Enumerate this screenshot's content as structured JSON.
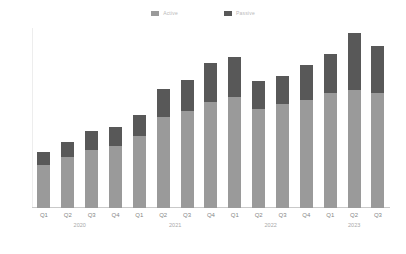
{
  "chart_data": {
    "type": "bar",
    "stacked": true,
    "title": "",
    "subtitle": "",
    "xlabel": "",
    "ylabel": "",
    "categories": [
      "Q1",
      "Q2",
      "Q3",
      "Q4",
      "Q1",
      "Q2",
      "Q3",
      "Q4",
      "Q1",
      "Q2",
      "Q3",
      "Q4",
      "Q1",
      "Q2",
      "Q3"
    ],
    "group_labels": [
      {
        "label": "2020",
        "center_index": 1.5
      },
      {
        "label": "2021",
        "center_index": 5.5
      },
      {
        "label": "2022",
        "center_index": 9.5
      },
      {
        "label": "2023",
        "center_index": 13.0
      }
    ],
    "series": [
      {
        "name": "Active",
        "color": "#9a9a9a",
        "values": [
          1.23,
          1.46,
          1.66,
          1.77,
          2.06,
          2.6,
          2.77,
          3.03,
          3.17,
          2.83,
          2.97,
          3.09,
          3.29,
          3.37,
          3.29
        ]
      },
      {
        "name": "Passive",
        "color": "#585858",
        "values": [
          0.37,
          0.43,
          0.54,
          0.54,
          0.6,
          0.8,
          0.89,
          1.11,
          1.14,
          0.8,
          0.8,
          1.0,
          1.11,
          1.63,
          1.34
        ]
      }
    ],
    "totals": [
      1.6,
      1.89,
      2.2,
      2.31,
      2.66,
      3.4,
      3.66,
      4.14,
      4.31,
      3.63,
      3.77,
      4.09,
      4.4,
      5.0,
      4.63
    ],
    "ylim": [
      0,
      5.14
    ],
    "yticks": [
      {
        "value": 1.0,
        "label": ""
      },
      {
        "value": 2.0,
        "label": ""
      },
      {
        "value": 3.0,
        "label": ""
      },
      {
        "value": 4.0,
        "label": ""
      },
      {
        "value": 5.0,
        "label": ""
      }
    ],
    "grid": false,
    "legend_position": "top-center"
  },
  "legend": {
    "items": [
      {
        "label": "Active",
        "color": "#9a9a9a"
      },
      {
        "label": "Passive",
        "color": "#585858"
      }
    ]
  },
  "colors": {
    "series_light": "#9a9a9a",
    "series_dark": "#585858",
    "axis": "#c9c9c9",
    "tick_text": "#868686",
    "background": "#ffffff"
  }
}
